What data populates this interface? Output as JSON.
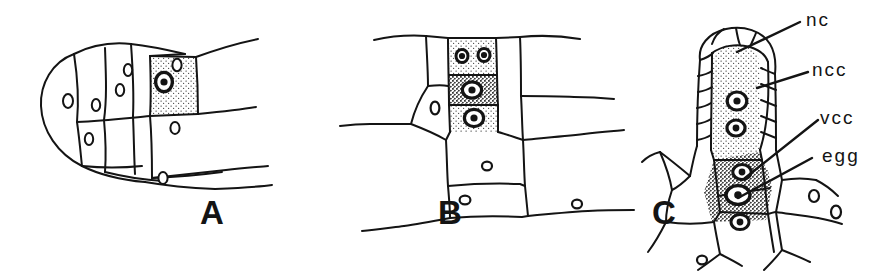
{
  "figure": {
    "background_color": "#ffffff",
    "ink_color": "#141414",
    "stipple_light_color": "#cfcfcf",
    "stipple_dark_color": "#8d8d8d"
  },
  "panels": [
    {
      "letter": "A",
      "name": "panel-a",
      "description": "Early archegonium initial; single stippled cell with nucleus in gametophyte tissue"
    },
    {
      "letter": "B",
      "name": "panel-b",
      "description": "Archegonium with three stacked stippled cells, upper cell divided into two nuclei"
    },
    {
      "letter": "C",
      "name": "panel-c",
      "description": "Mature archegonium with neck, neck canal cells, ventral canal cell and egg"
    }
  ],
  "labels": [
    {
      "text": "nc",
      "name": "label-nc"
    },
    {
      "text": "ncc",
      "name": "label-ncc"
    },
    {
      "text": "vcc",
      "name": "label-vcc"
    },
    {
      "text": "egg",
      "name": "label-egg"
    }
  ]
}
